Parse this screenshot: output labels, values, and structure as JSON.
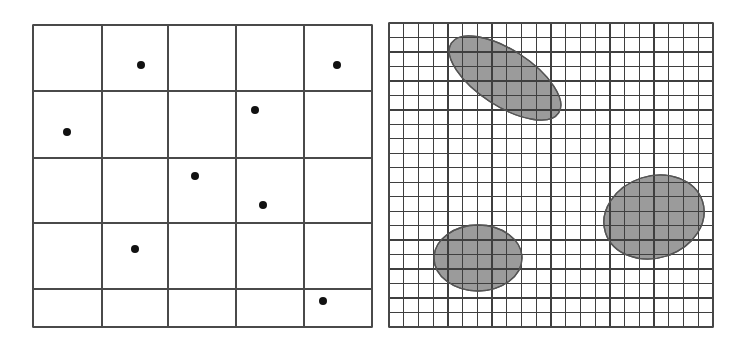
{
  "colors": {
    "background": "#ffffff",
    "grid_line": "#4a4a4a",
    "point": "#111111",
    "region_fill": "#9b9b9b",
    "region_stroke": "#555555"
  },
  "left_panel": {
    "name": "coarse-grid-with-points",
    "bounds": {
      "x0": 33,
      "y0": 25,
      "x1": 372,
      "y1": 327
    },
    "column_lines_x": [
      33,
      102,
      168,
      236,
      304,
      372
    ],
    "row_lines_y": [
      25,
      91,
      158,
      223,
      289,
      327
    ],
    "point_radius": 4,
    "points": [
      {
        "x": 141,
        "y": 65
      },
      {
        "x": 337,
        "y": 65
      },
      {
        "x": 255,
        "y": 110
      },
      {
        "x": 67,
        "y": 132
      },
      {
        "x": 195,
        "y": 176
      },
      {
        "x": 263,
        "y": 205
      },
      {
        "x": 135,
        "y": 249
      },
      {
        "x": 323,
        "y": 301
      }
    ]
  },
  "right_panel": {
    "name": "fine-grid-with-regions",
    "bounds": {
      "x0": 389,
      "y0": 23,
      "x1": 713,
      "y1": 327
    },
    "columns": 22,
    "rows": 21,
    "regions": [
      {
        "cx": 505,
        "cy": 78,
        "rx": 64,
        "ry": 28,
        "rotate": 33
      },
      {
        "cx": 478,
        "cy": 258,
        "rx": 44,
        "ry": 33,
        "rotate": 0
      },
      {
        "cx": 654,
        "cy": 217,
        "rx": 51,
        "ry": 41,
        "rotate": -18
      }
    ]
  }
}
